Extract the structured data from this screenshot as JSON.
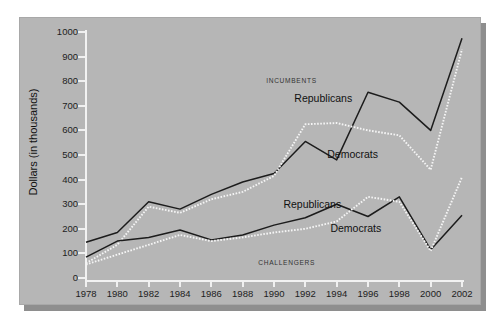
{
  "chart_data": {
    "type": "line",
    "title": "",
    "xlabel": "",
    "ylabel": "Dollars (in thousands)",
    "xlim": [
      1978,
      2002
    ],
    "ylim": [
      0,
      1000
    ],
    "grid": false,
    "legend_position": "inline-annotations",
    "x": [
      1978,
      1980,
      1982,
      1984,
      1986,
      1988,
      1990,
      1992,
      1994,
      1996,
      1998,
      2000,
      2002
    ],
    "xtick_labels": [
      "1978",
      "1980",
      "1982",
      "1984",
      "1986",
      "1988",
      "1990",
      "1992",
      "1994",
      "1996",
      "1998",
      "2000",
      "2002"
    ],
    "ytick_labels": [
      "0",
      "100",
      "200",
      "300",
      "400",
      "500",
      "600",
      "700",
      "800",
      "900",
      "1000"
    ],
    "ytick_values": [
      0,
      100,
      200,
      300,
      400,
      500,
      600,
      700,
      800,
      900,
      1000
    ],
    "annotations": [
      {
        "text": "INCUMBENTS",
        "x": 1989.5,
        "y": 800
      },
      {
        "text": "CHALLENGERS",
        "x": 1989.0,
        "y": 60
      }
    ],
    "series": [
      {
        "name": "Republicans",
        "group": "Incumbents",
        "style": "solid",
        "color": "#1c1c1c",
        "label_x": 1991.3,
        "label_y": 730,
        "values": [
          145,
          185,
          310,
          280,
          340,
          390,
          425,
          555,
          480,
          755,
          715,
          600,
          975
        ]
      },
      {
        "name": "Democrats",
        "group": "Incumbents",
        "style": "dotted",
        "color": "#f5f5f5",
        "label_x": 1993.4,
        "label_y": 505,
        "values": [
          60,
          135,
          290,
          265,
          320,
          350,
          415,
          625,
          630,
          600,
          580,
          440,
          930
        ]
      },
      {
        "name": "Republicans",
        "group": "Challengers",
        "style": "solid",
        "color": "#1c1c1c",
        "label_x": 1990.6,
        "label_y": 300,
        "values": [
          85,
          150,
          165,
          195,
          155,
          175,
          215,
          245,
          300,
          250,
          330,
          115,
          255
        ]
      },
      {
        "name": "Democrats",
        "group": "Challengers",
        "style": "dotted",
        "color": "#f5f5f5",
        "label_x": 1993.6,
        "label_y": 205,
        "values": [
          55,
          95,
          135,
          175,
          150,
          165,
          185,
          200,
          230,
          330,
          310,
          110,
          410
        ]
      }
    ]
  },
  "colors": {
    "panel_background": "#b6b6b6",
    "page_background": "#ffffff",
    "axis": "#f2f2f2",
    "solid_series": "#1c1c1c",
    "dotted_series": "#f5f5f5",
    "text": "#1d1d1d"
  }
}
